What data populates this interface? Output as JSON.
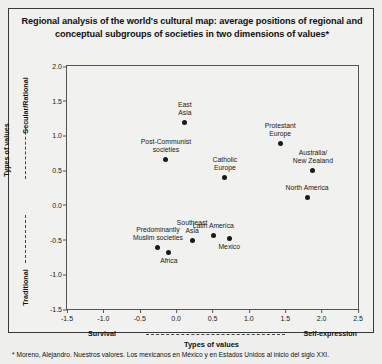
{
  "title": "Regional analysis of the world's cultural map: average positions of regional and conceptual subgroups of societies in two dimensions of values*",
  "footnote": "* Moreno, Alejandro.  Nuestros valores. Los mexicanos en México y en Estados Unidos al inicio del siglo XXI.",
  "axes": {
    "y_label_main": "Types of values",
    "y_label_top": "Secular/Rational",
    "y_label_bottom": "Traditional",
    "x_label_main": "Types of values",
    "x_label_left": "Survival",
    "x_label_right": "Self-expression"
  },
  "chart_data": {
    "type": "scatter",
    "title": "Regional analysis of the world's cultural map: average positions of regional and conceptual subgroups of societies in two dimensions of values*",
    "xlabel": "Types of values",
    "ylabel": "Types of values",
    "xlim": [
      -1.5,
      2.5
    ],
    "ylim": [
      -1.5,
      2.0
    ],
    "xticks": [
      "-1.5",
      "-1.0",
      "-0.5",
      "0.0",
      "0.5",
      "1.0",
      "1.5",
      "2.0",
      "2.5"
    ],
    "yticks": [
      "2.0",
      "1.5",
      "1.0",
      "0.5",
      "0.0",
      "-0.5",
      "-1.0",
      "-1.5"
    ],
    "grid": false,
    "legend": "none",
    "points": [
      {
        "label": "East\nAsia",
        "x": 0.12,
        "y": 1.19,
        "label_pos": "above"
      },
      {
        "label": "Post-Communist\nsocieties",
        "x": -0.14,
        "y": 0.66,
        "label_pos": "above"
      },
      {
        "label": "Catholic\nEurope",
        "x": 0.67,
        "y": 0.4,
        "label_pos": "above"
      },
      {
        "label": "Protestant\nEurope",
        "x": 1.43,
        "y": 0.89,
        "label_pos": "above"
      },
      {
        "label": "Australia/\nNew Zealand",
        "x": 1.88,
        "y": 0.5,
        "label_pos": "above"
      },
      {
        "label": "North America",
        "x": 1.8,
        "y": 0.11,
        "label_pos": "above"
      },
      {
        "label": "Predominantly\nMuslim societies",
        "x": -0.25,
        "y": -0.61,
        "label_pos": "above"
      },
      {
        "label": "Africa",
        "x": -0.1,
        "y": -0.68,
        "label_pos": "below"
      },
      {
        "label": "Southeast\nAsia",
        "x": 0.22,
        "y": -0.51,
        "label_pos": "above"
      },
      {
        "label": "Latin America",
        "x": 0.51,
        "y": -0.44,
        "label_pos": "above"
      },
      {
        "label": "Mexico",
        "x": 0.73,
        "y": -0.48,
        "label_pos": "below"
      }
    ]
  }
}
